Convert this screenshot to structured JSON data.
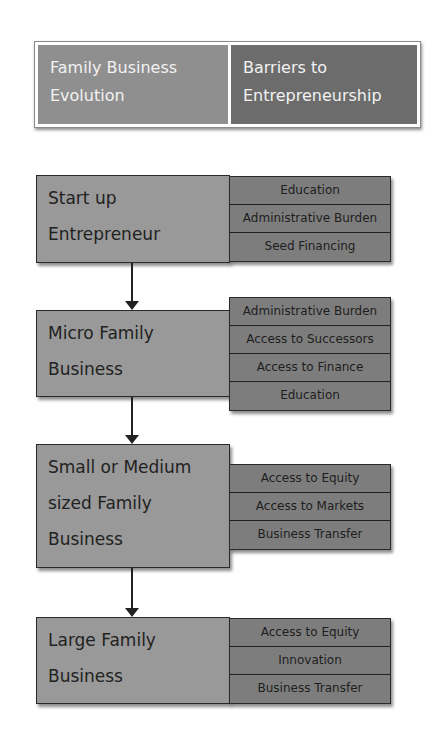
{
  "header": {
    "left_label": "Family Business Evolution",
    "left_lines": [
      "Family Business",
      "Evolution"
    ],
    "right_label": "Barriers to Entrepreneurship",
    "right_lines": [
      "Barriers to",
      "Entrepreneurship"
    ]
  },
  "stages": [
    {
      "title_lines": [
        "Start up",
        "Entrepreneur"
      ],
      "barriers": [
        "Education",
        "Administrative Burden",
        "Seed Financing"
      ]
    },
    {
      "title_lines": [
        "Micro Family",
        "Business"
      ],
      "barriers": [
        "Administrative Burden",
        "Access to Successors",
        "Access to Finance",
        "Education"
      ]
    },
    {
      "title_lines": [
        "Small or Medium",
        "sized Family",
        "Business"
      ],
      "barriers": [
        "Access to Equity",
        "Access to Markets",
        "Business Transfer"
      ]
    },
    {
      "title_lines": [
        "Large Family",
        "Business"
      ],
      "barriers": [
        "Access to Equity",
        "Innovation",
        "Business Transfer"
      ]
    }
  ],
  "colors": {
    "header_left": "#8f8f8f",
    "header_right": "#6c6c6c",
    "stage_fill": "#999999",
    "barrier_fill": "#7d7d7d",
    "border": "#2a2a2a"
  }
}
